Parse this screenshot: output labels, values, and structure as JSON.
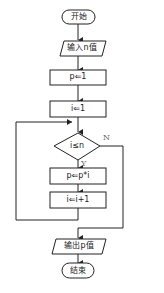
{
  "flowchart": {
    "start": {
      "label": "开始"
    },
    "input": {
      "label": "输入n值"
    },
    "init_p": {
      "label": "p⇐1"
    },
    "init_i": {
      "label": "i⇐1"
    },
    "condition": {
      "label": "i≤n",
      "yes_label": "Y",
      "no_label": "N"
    },
    "update_p": {
      "label": "p⇐p*i"
    },
    "update_i": {
      "label": "i⇐i+1"
    },
    "output": {
      "label": "输出p值"
    },
    "end": {
      "label": "结束"
    }
  },
  "colors": {
    "stroke": "#222222",
    "background": "#ffffff",
    "branch_label": "#666666"
  }
}
